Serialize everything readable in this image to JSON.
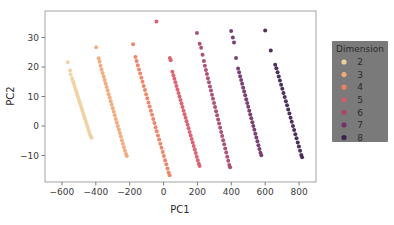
{
  "chart_data": {
    "type": "scatter",
    "title": "",
    "xlabel": "PC1",
    "ylabel": "PC2",
    "xlim": [
      -700,
      900
    ],
    "ylim": [
      -19,
      39
    ],
    "xticks": [
      -600,
      -400,
      -200,
      0,
      200,
      400,
      600,
      800
    ],
    "yticks": [
      -10,
      0,
      10,
      20,
      30
    ],
    "grid": false,
    "legend": {
      "title": "Dimension",
      "position": "right-outside",
      "facecolor": "#7a7a7a",
      "entries": [
        {
          "label": "2",
          "color": "#f0d0a0"
        },
        {
          "label": "3",
          "color": "#f0a878"
        },
        {
          "label": "4",
          "color": "#ec7f63"
        },
        {
          "label": "5",
          "color": "#d85a6a"
        },
        {
          "label": "6",
          "color": "#a8456e"
        },
        {
          "label": "7",
          "color": "#73316b"
        },
        {
          "label": "8",
          "color": "#3e2150"
        }
      ]
    },
    "series": [
      {
        "name": "2",
        "color": "#f0d0a0",
        "points": [
          [
            -566,
            21.6
          ],
          [
            -552,
            18.8
          ],
          [
            -548,
            17.5
          ],
          [
            -540,
            16.2
          ],
          [
            -535,
            15.2
          ],
          [
            -530,
            14.3
          ],
          [
            -525,
            13.4
          ],
          [
            -520,
            12.5
          ],
          [
            -515,
            11.6
          ],
          [
            -510,
            10.7
          ],
          [
            -505,
            9.8
          ],
          [
            -500,
            8.9
          ],
          [
            -495,
            8.0
          ],
          [
            -490,
            7.1
          ],
          [
            -485,
            6.2
          ],
          [
            -480,
            5.3
          ],
          [
            -475,
            4.4
          ],
          [
            -470,
            3.5
          ],
          [
            -465,
            2.6
          ],
          [
            -460,
            1.7
          ],
          [
            -455,
            0.8
          ],
          [
            -450,
            -0.1
          ],
          [
            -445,
            -1.0
          ],
          [
            -440,
            -1.9
          ],
          [
            -435,
            -2.8
          ],
          [
            -430,
            -3.4
          ],
          [
            -425,
            -4.0
          ]
        ]
      },
      {
        "name": "3",
        "color": "#f0a878",
        "points": [
          [
            -398,
            26.7
          ],
          [
            -383,
            23.0
          ],
          [
            -378,
            21.8
          ],
          [
            -372,
            20.4
          ],
          [
            -366,
            19.2
          ],
          [
            -360,
            18.0
          ],
          [
            -354,
            16.8
          ],
          [
            -348,
            15.6
          ],
          [
            -342,
            14.4
          ],
          [
            -336,
            13.2
          ],
          [
            -330,
            12.0
          ],
          [
            -324,
            10.8
          ],
          [
            -318,
            9.6
          ],
          [
            -312,
            8.4
          ],
          [
            -306,
            7.2
          ],
          [
            -300,
            6.0
          ],
          [
            -294,
            4.8
          ],
          [
            -288,
            3.6
          ],
          [
            -282,
            2.4
          ],
          [
            -276,
            1.2
          ],
          [
            -270,
            0.0
          ],
          [
            -264,
            -1.2
          ],
          [
            -258,
            -2.4
          ],
          [
            -252,
            -3.6
          ],
          [
            -246,
            -4.8
          ],
          [
            -240,
            -6.0
          ],
          [
            -234,
            -7.2
          ],
          [
            -228,
            -8.4
          ],
          [
            -222,
            -9.5
          ],
          [
            -217,
            -10.2
          ]
        ]
      },
      {
        "name": "4",
        "color": "#ec7f63",
        "points": [
          [
            -180,
            27.7
          ],
          [
            -166,
            23.4
          ],
          [
            -159,
            22.0
          ],
          [
            -152,
            20.6
          ],
          [
            -145,
            19.2
          ],
          [
            -138,
            17.8
          ],
          [
            -131,
            16.4
          ],
          [
            -124,
            15.0
          ],
          [
            -117,
            13.6
          ],
          [
            -110,
            12.2
          ],
          [
            -103,
            10.8
          ],
          [
            -96,
            9.4
          ],
          [
            -89,
            8.0
          ],
          [
            -82,
            6.6
          ],
          [
            -75,
            5.2
          ],
          [
            -68,
            3.8
          ],
          [
            -61,
            2.4
          ],
          [
            -54,
            1.0
          ],
          [
            -47,
            -0.4
          ],
          [
            -40,
            -1.8
          ],
          [
            -33,
            -3.2
          ],
          [
            -26,
            -4.6
          ],
          [
            -19,
            -6.0
          ],
          [
            -12,
            -7.4
          ],
          [
            -5,
            -8.8
          ],
          [
            2,
            -10.2
          ],
          [
            9,
            -11.6
          ],
          [
            16,
            -13.0
          ],
          [
            23,
            -14.4
          ],
          [
            30,
            -15.8
          ],
          [
            36,
            -16.7
          ]
        ]
      },
      {
        "name": "5",
        "color": "#d85a6a",
        "points": [
          [
            -42,
            35.4
          ],
          [
            37,
            23.1
          ],
          [
            42,
            22.3
          ],
          [
            52,
            18.4
          ],
          [
            58,
            17.2
          ],
          [
            64,
            16.0
          ],
          [
            70,
            14.8
          ],
          [
            76,
            13.6
          ],
          [
            82,
            12.4
          ],
          [
            88,
            11.2
          ],
          [
            94,
            10.0
          ],
          [
            100,
            8.8
          ],
          [
            106,
            7.6
          ],
          [
            112,
            6.4
          ],
          [
            118,
            5.2
          ],
          [
            124,
            4.0
          ],
          [
            130,
            2.8
          ],
          [
            136,
            1.6
          ],
          [
            142,
            0.4
          ],
          [
            148,
            -0.8
          ],
          [
            154,
            -2.0
          ],
          [
            160,
            -3.2
          ],
          [
            166,
            -4.4
          ],
          [
            172,
            -5.6
          ],
          [
            178,
            -6.8
          ],
          [
            184,
            -8.0
          ],
          [
            190,
            -9.2
          ],
          [
            196,
            -10.4
          ],
          [
            202,
            -11.6
          ],
          [
            208,
            -12.8
          ],
          [
            213,
            -13.6
          ]
        ]
      },
      {
        "name": "6",
        "color": "#a8456e",
        "points": [
          [
            197,
            31.5
          ],
          [
            213,
            27.9
          ],
          [
            222,
            26.5
          ],
          [
            230,
            24.2
          ],
          [
            238,
            22.0
          ],
          [
            244,
            20.4
          ],
          [
            250,
            19.0
          ],
          [
            256,
            17.6
          ],
          [
            262,
            16.2
          ],
          [
            268,
            14.8
          ],
          [
            274,
            13.4
          ],
          [
            280,
            12.0
          ],
          [
            286,
            10.6
          ],
          [
            292,
            9.2
          ],
          [
            298,
            7.8
          ],
          [
            304,
            6.4
          ],
          [
            310,
            5.0
          ],
          [
            316,
            3.6
          ],
          [
            322,
            2.2
          ],
          [
            328,
            0.8
          ],
          [
            334,
            -0.6
          ],
          [
            340,
            -2.0
          ],
          [
            346,
            -3.4
          ],
          [
            352,
            -4.8
          ],
          [
            358,
            -6.2
          ],
          [
            364,
            -7.6
          ],
          [
            370,
            -9.0
          ],
          [
            376,
            -10.4
          ],
          [
            382,
            -11.8
          ],
          [
            388,
            -13.2
          ],
          [
            393,
            -14.0
          ]
        ]
      },
      {
        "name": "7",
        "color": "#73316b",
        "points": [
          [
            399,
            32.2
          ],
          [
            409,
            30.0
          ],
          [
            416,
            28.3
          ],
          [
            428,
            23.1
          ],
          [
            440,
            19.5
          ],
          [
            446,
            18.2
          ],
          [
            452,
            16.9
          ],
          [
            458,
            15.6
          ],
          [
            464,
            14.3
          ],
          [
            470,
            13.0
          ],
          [
            476,
            11.7
          ],
          [
            482,
            10.4
          ],
          [
            488,
            9.1
          ],
          [
            494,
            7.8
          ],
          [
            500,
            6.5
          ],
          [
            506,
            5.2
          ],
          [
            512,
            3.9
          ],
          [
            518,
            2.6
          ],
          [
            524,
            1.3
          ],
          [
            530,
            0.0
          ],
          [
            536,
            -1.3
          ],
          [
            542,
            -2.6
          ],
          [
            548,
            -3.9
          ],
          [
            554,
            -5.2
          ],
          [
            560,
            -6.5
          ],
          [
            566,
            -7.8
          ],
          [
            572,
            -9.1
          ],
          [
            577,
            -9.9
          ]
        ]
      },
      {
        "name": "8",
        "color": "#3e2150",
        "points": [
          [
            600,
            32.4
          ],
          [
            633,
            25.6
          ],
          [
            659,
            20.8
          ],
          [
            666,
            19.6
          ],
          [
            673,
            18.2
          ],
          [
            680,
            16.8
          ],
          [
            687,
            15.4
          ],
          [
            694,
            14.0
          ],
          [
            701,
            12.6
          ],
          [
            708,
            11.2
          ],
          [
            715,
            9.8
          ],
          [
            722,
            8.4
          ],
          [
            729,
            7.0
          ],
          [
            736,
            5.6
          ],
          [
            743,
            4.2
          ],
          [
            750,
            2.8
          ],
          [
            757,
            1.4
          ],
          [
            764,
            0.0
          ],
          [
            771,
            -1.4
          ],
          [
            778,
            -2.8
          ],
          [
            785,
            -4.2
          ],
          [
            792,
            -5.6
          ],
          [
            799,
            -7.0
          ],
          [
            806,
            -8.4
          ],
          [
            813,
            -9.8
          ],
          [
            818,
            -10.6
          ]
        ]
      }
    ]
  }
}
